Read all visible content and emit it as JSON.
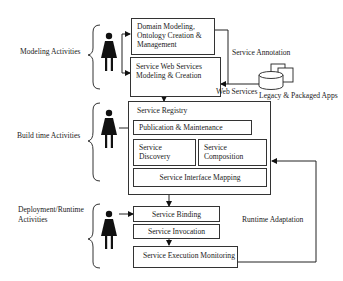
{
  "phases": [
    {
      "label": "Modeling Activities"
    },
    {
      "label": "Build time Activities"
    },
    {
      "label": "Deployment/Runtime Activities",
      "lines": [
        "Deployment/Runtime",
        "Activities"
      ]
    }
  ],
  "modeling": {
    "domain_box": {
      "lines": [
        "Domain Modeling,",
        "Ontology Creation &",
        "Management"
      ]
    },
    "sws_box": {
      "lines": [
        "Service Web Services",
        "Modeling & Creation"
      ]
    },
    "service_annotation": "Service Annotation",
    "web_services": "Web Services",
    "legacy_apps": "Legacy & Packaged Apps"
  },
  "build": {
    "registry_title": "Service Registry",
    "publication": "Publication & Maintenance",
    "discovery": {
      "lines": [
        "Service",
        "Discovery"
      ]
    },
    "composition": {
      "lines": [
        "Service",
        "Composition"
      ]
    },
    "interface_mapping": "Service Interface Mapping"
  },
  "runtime": {
    "binding": "Service Binding",
    "invocation": "Service Invocation",
    "monitoring": "Service Execution Monitoring",
    "adaptation": "Runtime Adaptation"
  },
  "icons": {
    "actor": "person-icon",
    "store": "database-icon"
  },
  "colors": {
    "line": "#222222",
    "background": "#ffffff"
  }
}
